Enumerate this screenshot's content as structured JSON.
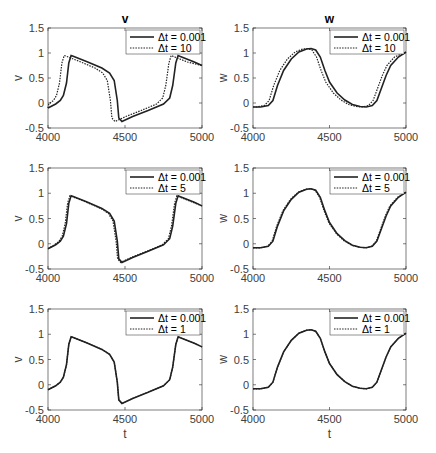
{
  "chart_data": [
    {
      "type": "line",
      "panel": "row1-left",
      "title": "v",
      "xlabel": "",
      "ylabel": "v",
      "xlim": [
        4000,
        5000
      ],
      "ylim": [
        -0.5,
        1.5
      ],
      "xticks": [
        "4000",
        "4500",
        "5000"
      ],
      "yticks": [
        "-0.5",
        "0",
        "0.5",
        "1",
        "1.5"
      ],
      "legend": [
        "Δt = 0.001",
        "Δt = 10"
      ],
      "var": "v",
      "shift": 45
    },
    {
      "type": "line",
      "panel": "row1-right",
      "title": "w",
      "xlabel": "",
      "ylabel": "w",
      "xlim": [
        4000,
        5000
      ],
      "ylim": [
        -0.5,
        1.5
      ],
      "xticks": [
        "4000",
        "4500",
        "5000"
      ],
      "yticks": [
        "-0.5",
        "0",
        "0.5",
        "1",
        "1.5"
      ],
      "legend": [
        "Δt = 0.001",
        "Δt = 10"
      ],
      "var": "w",
      "shift": 25
    },
    {
      "type": "line",
      "panel": "row2-left",
      "title": "",
      "xlabel": "",
      "ylabel": "v",
      "xlim": [
        4000,
        5000
      ],
      "ylim": [
        -0.5,
        1.5
      ],
      "xticks": [
        "4000",
        "4500",
        "5000"
      ],
      "yticks": [
        "-0.5",
        "0",
        "0.5",
        "1",
        "1.5"
      ],
      "legend": [
        "Δt = 0.001",
        "Δt = 5"
      ],
      "var": "v",
      "shift": 8
    },
    {
      "type": "line",
      "panel": "row2-right",
      "title": "",
      "xlabel": "",
      "ylabel": "w",
      "xlim": [
        4000,
        5000
      ],
      "ylim": [
        -0.5,
        1.5
      ],
      "xticks": [
        "4000",
        "4500",
        "5000"
      ],
      "yticks": [
        "-0.5",
        "0",
        "0.5",
        "1",
        "1.5"
      ],
      "legend": [
        "Δt = 0.001",
        "Δt = 5"
      ],
      "var": "w",
      "shift": 5
    },
    {
      "type": "line",
      "panel": "row3-left",
      "title": "",
      "xlabel": "t",
      "ylabel": "v",
      "xlim": [
        4000,
        5000
      ],
      "ylim": [
        -0.5,
        1.5
      ],
      "xticks": [
        "4000",
        "4500",
        "5000"
      ],
      "yticks": [
        "-0.5",
        "0",
        "0.5",
        "1",
        "1.5"
      ],
      "legend": [
        "Δt = 0.001",
        "Δt = 1"
      ],
      "var": "v",
      "shift": 0
    },
    {
      "type": "line",
      "panel": "row3-right",
      "title": "",
      "xlabel": "t",
      "ylabel": "w",
      "xlim": [
        4000,
        5000
      ],
      "ylim": [
        -0.5,
        1.5
      ],
      "xticks": [
        "4000",
        "4500",
        "5000"
      ],
      "yticks": [
        "-0.5",
        "0",
        "0.5",
        "1",
        "1.5"
      ],
      "legend": [
        "Δt = 0.001",
        "Δt = 1"
      ],
      "var": "w",
      "shift": 0
    }
  ],
  "series_ref": {
    "v": {
      "t": [
        4000,
        4050,
        4080,
        4100,
        4120,
        4135,
        4150,
        4160,
        4250,
        4350,
        4400,
        4430,
        4450,
        4460,
        4480,
        4550,
        4650,
        4750,
        4790,
        4810,
        4830,
        4845,
        4860,
        4950,
        5000
      ],
      "y": [
        -0.1,
        -0.02,
        0.05,
        0.15,
        0.4,
        0.8,
        0.95,
        0.94,
        0.83,
        0.7,
        0.6,
        0.45,
        0.05,
        -0.3,
        -0.37,
        -0.27,
        -0.15,
        -0.02,
        0.1,
        0.35,
        0.8,
        0.95,
        0.93,
        0.82,
        0.75
      ]
    },
    "w": {
      "t": [
        4000,
        4050,
        4100,
        4130,
        4160,
        4200,
        4250,
        4300,
        4350,
        4380,
        4410,
        4440,
        4470,
        4500,
        4550,
        4600,
        4650,
        4700,
        4740,
        4780,
        4810,
        4840,
        4870,
        4900,
        4950,
        5000
      ],
      "y": [
        -0.08,
        -0.08,
        -0.05,
        0.05,
        0.35,
        0.65,
        0.88,
        1.02,
        1.08,
        1.09,
        1.06,
        0.92,
        0.65,
        0.42,
        0.2,
        0.06,
        -0.03,
        -0.07,
        -0.08,
        -0.05,
        0.05,
        0.3,
        0.55,
        0.75,
        0.92,
        1.02
      ]
    }
  }
}
